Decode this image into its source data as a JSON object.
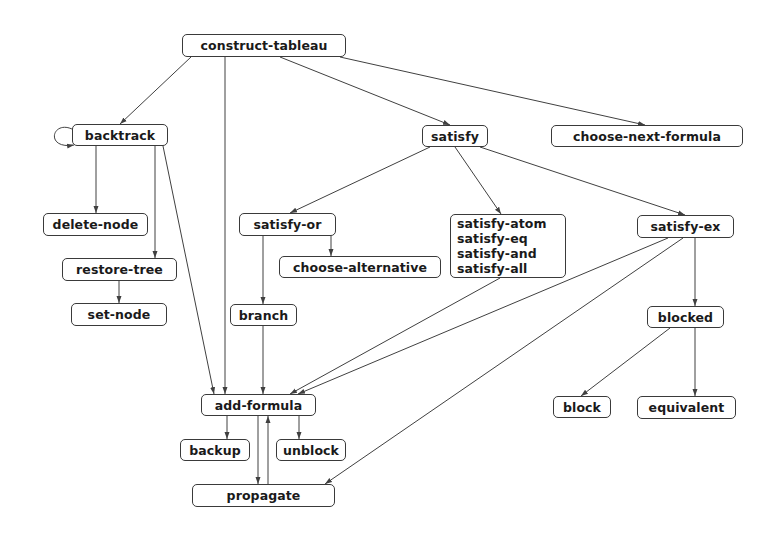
{
  "diagram": {
    "title": "",
    "nodes": {
      "construct_tableau": {
        "label": "construct-tableau",
        "x": 182,
        "y": 34,
        "w": 164,
        "h": 23
      },
      "backtrack": {
        "label": "backtrack",
        "x": 72,
        "y": 124,
        "w": 96,
        "h": 22
      },
      "satisfy": {
        "label": "satisfy",
        "x": 422,
        "y": 125,
        "w": 66,
        "h": 22
      },
      "choose_next_formula": {
        "label": "choose-next-formula",
        "x": 551,
        "y": 125,
        "w": 192,
        "h": 22
      },
      "delete_node": {
        "label": "delete-node",
        "x": 43,
        "y": 213,
        "w": 105,
        "h": 23
      },
      "restore_tree": {
        "label": "restore-tree",
        "x": 62,
        "y": 258,
        "w": 115,
        "h": 23
      },
      "set_node": {
        "label": "set-node",
        "x": 71,
        "y": 303,
        "w": 96,
        "h": 23
      },
      "satisfy_or": {
        "label": "satisfy-or",
        "x": 239,
        "y": 213,
        "w": 97,
        "h": 23
      },
      "choose_alternative": {
        "label": "choose-alternative",
        "x": 279,
        "y": 256,
        "w": 162,
        "h": 22
      },
      "satisfy_group": {
        "lines": [
          "satisfy-atom",
          "satisfy-eq",
          "satisfy-and",
          "satisfy-all"
        ],
        "x": 450,
        "y": 214,
        "w": 116,
        "h": 64
      },
      "satisfy_ex": {
        "label": "satisfy-ex",
        "x": 637,
        "y": 215,
        "w": 97,
        "h": 23
      },
      "branch": {
        "label": "branch",
        "x": 230,
        "y": 304,
        "w": 67,
        "h": 22
      },
      "blocked": {
        "label": "blocked",
        "x": 647,
        "y": 306,
        "w": 77,
        "h": 22
      },
      "add_formula": {
        "label": "add-formula",
        "x": 201,
        "y": 394,
        "w": 115,
        "h": 22
      },
      "block": {
        "label": "block",
        "x": 553,
        "y": 396,
        "w": 58,
        "h": 22
      },
      "equivalent": {
        "label": "equivalent",
        "x": 637,
        "y": 396,
        "w": 99,
        "h": 23
      },
      "backup": {
        "label": "backup",
        "x": 180,
        "y": 439,
        "w": 70,
        "h": 22
      },
      "unblock": {
        "label": "unblock",
        "x": 276,
        "y": 439,
        "w": 70,
        "h": 22
      },
      "propagate": {
        "label": "propagate",
        "x": 192,
        "y": 484,
        "w": 143,
        "h": 23
      }
    },
    "edges": [
      {
        "from": "construct-tableau",
        "to": "backtrack",
        "x1": 191,
        "y1": 57,
        "x2": 120,
        "y2": 124
      },
      {
        "from": "construct-tableau",
        "to": "add-formula",
        "x1": 225,
        "y1": 57,
        "x2": 225,
        "y2": 394
      },
      {
        "from": "construct-tableau",
        "to": "satisfy",
        "x1": 280,
        "y1": 57,
        "x2": 450,
        "y2": 125
      },
      {
        "from": "construct-tableau",
        "to": "choose-next-formula",
        "x1": 340,
        "y1": 57,
        "x2": 645,
        "y2": 125
      },
      {
        "from": "backtrack",
        "to": "delete-node",
        "x1": 96,
        "y1": 146,
        "x2": 96,
        "y2": 213
      },
      {
        "from": "backtrack",
        "to": "restore-tree",
        "x1": 155,
        "y1": 146,
        "x2": 155,
        "y2": 258
      },
      {
        "from": "backtrack",
        "to": "add-formula",
        "x1": 163,
        "y1": 146,
        "x2": 214,
        "y2": 394
      },
      {
        "from": "restore-tree",
        "to": "set-node",
        "x1": 119,
        "y1": 281,
        "x2": 119,
        "y2": 303
      },
      {
        "from": "satisfy",
        "to": "satisfy-or",
        "x1": 430,
        "y1": 147,
        "x2": 290,
        "y2": 213
      },
      {
        "from": "satisfy",
        "to": "satisfy-group",
        "x1": 455,
        "y1": 147,
        "x2": 501,
        "y2": 214
      },
      {
        "from": "satisfy",
        "to": "satisfy-ex",
        "x1": 480,
        "y1": 147,
        "x2": 685,
        "y2": 215
      },
      {
        "from": "satisfy-or",
        "to": "choose-alternative",
        "x1": 331,
        "y1": 236,
        "x2": 331,
        "y2": 256
      },
      {
        "from": "satisfy-or",
        "to": "branch",
        "x1": 263,
        "y1": 236,
        "x2": 263,
        "y2": 304
      },
      {
        "from": "branch",
        "to": "add-formula",
        "x1": 263,
        "y1": 326,
        "x2": 263,
        "y2": 394
      },
      {
        "from": "satisfy-group",
        "to": "add-formula",
        "x1": 500,
        "y1": 278,
        "x2": 290,
        "y2": 394
      },
      {
        "from": "satisfy-ex",
        "to": "add-formula",
        "x1": 668,
        "y1": 238,
        "x2": 298,
        "y2": 394
      },
      {
        "from": "satisfy-ex",
        "to": "propagate",
        "x1": 683,
        "y1": 238,
        "x2": 325,
        "y2": 484
      },
      {
        "from": "satisfy-ex",
        "to": "blocked",
        "x1": 695,
        "y1": 238,
        "x2": 695,
        "y2": 306
      },
      {
        "from": "blocked",
        "to": "block",
        "x1": 670,
        "y1": 328,
        "x2": 581,
        "y2": 396
      },
      {
        "from": "blocked",
        "to": "equivalent",
        "x1": 695,
        "y1": 328,
        "x2": 695,
        "y2": 396
      },
      {
        "from": "add-formula",
        "to": "backup",
        "x1": 227,
        "y1": 416,
        "x2": 227,
        "y2": 439
      },
      {
        "from": "add-formula",
        "to": "unblock",
        "x1": 299,
        "y1": 416,
        "x2": 299,
        "y2": 439
      },
      {
        "from": "add-formula",
        "to": "propagate",
        "x1": 258,
        "y1": 416,
        "x2": 258,
        "y2": 484
      },
      {
        "from": "propagate",
        "to": "add-formula",
        "x1": 268,
        "y1": 484,
        "x2": 268,
        "y2": 416
      },
      {
        "from": "backtrack",
        "to": "backtrack",
        "self_loop": true
      }
    ],
    "colors": {
      "line": "#404040",
      "border": "#3a3a3a",
      "text": "#1a1a1a",
      "background": "#ffffff"
    }
  }
}
